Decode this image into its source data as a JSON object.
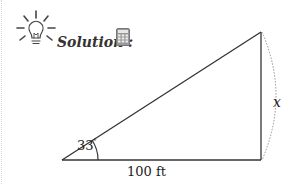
{
  "header": {
    "title": "Solution :",
    "icons": [
      "lightbulb-icon",
      "calculator-icon"
    ]
  },
  "diagram": {
    "type": "right-triangle",
    "angle_label": "33",
    "angle_unit": "°",
    "base_label": "100 ft",
    "height_label": "x",
    "line_color": "#333333",
    "dashed_arc_color": "#888888"
  }
}
